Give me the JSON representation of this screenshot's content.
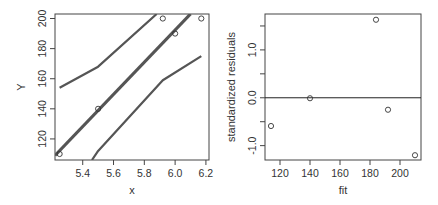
{
  "chart_data": [
    {
      "type": "line",
      "title": "",
      "xlabel": "x",
      "ylabel": "Y",
      "xlim": [
        5.22,
        6.22
      ],
      "ylim": [
        106,
        203
      ],
      "xticks": [
        5.4,
        5.6,
        5.8,
        6.0,
        6.2
      ],
      "xtick_labels": [
        "5.4",
        "5.6",
        "5.8",
        "6.0",
        "6.2"
      ],
      "yticks": [
        120,
        140,
        160,
        180,
        200
      ],
      "ytick_labels": [
        "120",
        "140",
        "160",
        "180",
        "200"
      ],
      "grid": false,
      "legend": null,
      "series": [
        {
          "name": "observed",
          "kind": "scatter",
          "x": [
            5.25,
            5.5,
            5.92,
            6.0,
            6.17
          ],
          "y": [
            110,
            140,
            200,
            190,
            200
          ]
        },
        {
          "name": "fitted",
          "kind": "line",
          "x": [
            5.22,
            6.1
          ],
          "y": [
            109,
            203
          ]
        },
        {
          "name": "upper band",
          "kind": "line",
          "x": [
            5.25,
            5.5,
            5.88
          ],
          "y": [
            154,
            168,
            203
          ]
        },
        {
          "name": "lower band",
          "kind": "line",
          "x": [
            5.46,
            5.5,
            5.92,
            6.17
          ],
          "y": [
            106,
            112,
            159,
            175
          ]
        }
      ]
    },
    {
      "type": "scatter",
      "title": "",
      "xlabel": "fit",
      "ylabel": "standardized residuals",
      "xlim": [
        110,
        214
      ],
      "ylim": [
        -1.3,
        1.75
      ],
      "xticks": [
        120,
        140,
        160,
        180,
        200
      ],
      "xtick_labels": [
        "120",
        "140",
        "160",
        "180",
        "200"
      ],
      "yticks": [
        -1.0,
        -0.5,
        0.0,
        0.5,
        1.0,
        1.5
      ],
      "ytick_labels": [
        "-1.0",
        "",
        "0.0",
        "",
        "1.0",
        ""
      ],
      "hline": 0.0,
      "grid": false,
      "legend": null,
      "series": [
        {
          "name": "residuals",
          "x": [
            114,
            140,
            184,
            192,
            210
          ],
          "y": [
            -0.59,
            -0.01,
            1.63,
            -0.25,
            -1.2
          ]
        }
      ]
    }
  ]
}
